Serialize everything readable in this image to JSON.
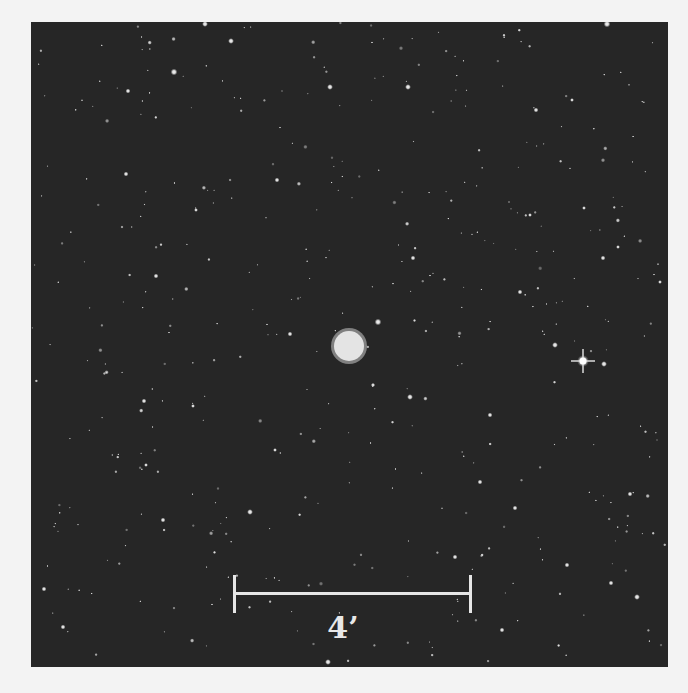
{
  "image": {
    "description": "Astronomical field image with central bright diffuse object",
    "background_color": "#262626",
    "page_background": "#f3f3f3"
  },
  "scale_bar": {
    "label": "4’",
    "color": "#e6e6e6"
  },
  "central_object": {
    "cx": 349,
    "cy": 346,
    "r": 16
  },
  "bright_star": {
    "cx": 583,
    "cy": 361
  }
}
